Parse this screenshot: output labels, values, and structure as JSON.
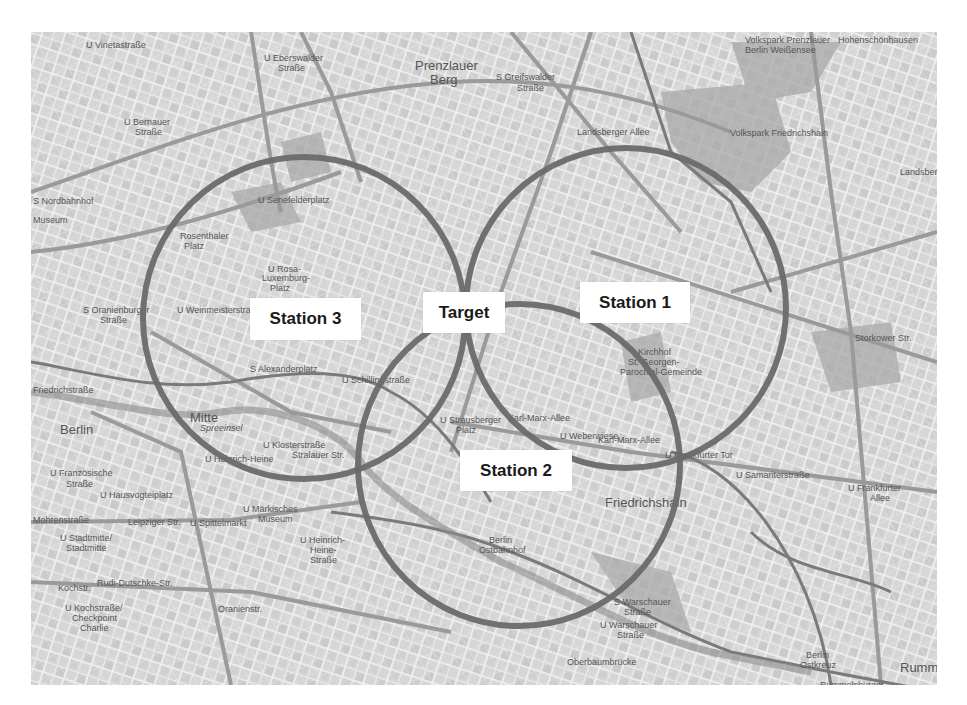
{
  "map": {
    "city": "Berlin",
    "style": "grayscale street map",
    "background_color": "#d9d9d9",
    "circle_color": "#6a6a6a",
    "place_labels": [
      {
        "text": "U Vinetastraße",
        "x": 86,
        "y": 45
      },
      {
        "text": "U Eberswalder",
        "x": 264,
        "y": 58
      },
      {
        "text": "Straße",
        "x": 278,
        "y": 68
      },
      {
        "text": "Prenzlauer",
        "x": 415,
        "y": 66,
        "big": true
      },
      {
        "text": "Berg",
        "x": 430,
        "y": 80,
        "big": true
      },
      {
        "text": "S Greifswalder",
        "x": 496,
        "y": 77
      },
      {
        "text": "Straße",
        "x": 517,
        "y": 88
      },
      {
        "text": "Hohenschönhausen",
        "x": 838,
        "y": 40
      },
      {
        "text": "Volkspark Prenzlauer",
        "x": 745,
        "y": 40
      },
      {
        "text": "Berlin Weißensee",
        "x": 745,
        "y": 50
      },
      {
        "text": "U Bernauer",
        "x": 124,
        "y": 122
      },
      {
        "text": "Straße",
        "x": 135,
        "y": 132
      },
      {
        "text": "Landsberger Allee",
        "x": 577,
        "y": 132
      },
      {
        "text": "Volkspark Friedrichshain",
        "x": 730,
        "y": 133
      },
      {
        "text": "U Senefelderplatz",
        "x": 258,
        "y": 200
      },
      {
        "text": "S Nordbahnhof",
        "x": 33,
        "y": 201
      },
      {
        "text": "Museum",
        "x": 33,
        "y": 220
      },
      {
        "text": "Rosenthaler",
        "x": 180,
        "y": 236
      },
      {
        "text": "Platz",
        "x": 184,
        "y": 246
      },
      {
        "text": "U Rosa-",
        "x": 268,
        "y": 269
      },
      {
        "text": "Luxemburg-",
        "x": 262,
        "y": 278
      },
      {
        "text": "Platz",
        "x": 270,
        "y": 288
      },
      {
        "text": "Landsberger",
        "x": 900,
        "y": 172
      },
      {
        "text": "S Oranienburger",
        "x": 83,
        "y": 310
      },
      {
        "text": "Straße",
        "x": 100,
        "y": 320
      },
      {
        "text": "U Weinmeisterstraße",
        "x": 177,
        "y": 310
      },
      {
        "text": "S Alexanderplatz",
        "x": 250,
        "y": 369
      },
      {
        "text": "U Schillingstraße",
        "x": 342,
        "y": 380
      },
      {
        "text": "Kirchhof",
        "x": 638,
        "y": 352
      },
      {
        "text": "St. Georgen-",
        "x": 628,
        "y": 362
      },
      {
        "text": "Parochial-Gemeinde",
        "x": 620,
        "y": 372
      },
      {
        "text": "Storkower Str.",
        "x": 855,
        "y": 338
      },
      {
        "text": "Friedrichstraße",
        "x": 33,
        "y": 390
      },
      {
        "text": "Berlin",
        "x": 60,
        "y": 430,
        "big": true
      },
      {
        "text": "Mitte",
        "x": 190,
        "y": 418,
        "big": true
      },
      {
        "text": "Spreeinsel",
        "x": 200,
        "y": 428,
        "italic": true
      },
      {
        "text": "U Strausberger",
        "x": 440,
        "y": 420
      },
      {
        "text": "Platz",
        "x": 456,
        "y": 430
      },
      {
        "text": "Karl-Marx-Allee",
        "x": 508,
        "y": 418
      },
      {
        "text": "U Weberwiese",
        "x": 560,
        "y": 436
      },
      {
        "text": "Karl-Marx-Allee",
        "x": 598,
        "y": 440
      },
      {
        "text": "U Frankfurter Tor",
        "x": 665,
        "y": 455
      },
      {
        "text": "U Klosterstraße",
        "x": 263,
        "y": 445
      },
      {
        "text": "Stralauer Str.",
        "x": 292,
        "y": 455
      },
      {
        "text": "U Heinrich-Heine",
        "x": 205,
        "y": 459
      },
      {
        "text": "U Samariterstraße",
        "x": 736,
        "y": 475
      },
      {
        "text": "U Französische",
        "x": 50,
        "y": 473
      },
      {
        "text": "Straße",
        "x": 66,
        "y": 484
      },
      {
        "text": "U Hausvogteiplatz",
        "x": 100,
        "y": 495
      },
      {
        "text": "Friedrichshain",
        "x": 605,
        "y": 503,
        "big": true
      },
      {
        "text": "U Frankfurter",
        "x": 848,
        "y": 488
      },
      {
        "text": "Allee",
        "x": 870,
        "y": 498
      },
      {
        "text": "Leipziger Str.",
        "x": 128,
        "y": 522
      },
      {
        "text": "U Spittelmarkt",
        "x": 190,
        "y": 523
      },
      {
        "text": "U Märkisches",
        "x": 243,
        "y": 509
      },
      {
        "text": "Museum",
        "x": 258,
        "y": 519
      },
      {
        "text": "Mohrenstraße",
        "x": 33,
        "y": 520
      },
      {
        "text": "U Stadtmitte/",
        "x": 60,
        "y": 538
      },
      {
        "text": "Stadtmitte",
        "x": 66,
        "y": 548
      },
      {
        "text": "U Heinrich-",
        "x": 300,
        "y": 540
      },
      {
        "text": "Heine-",
        "x": 310,
        "y": 550
      },
      {
        "text": "Straße",
        "x": 310,
        "y": 560
      },
      {
        "text": "Berlin",
        "x": 489,
        "y": 540
      },
      {
        "text": "Ostbahnhof",
        "x": 479,
        "y": 550
      },
      {
        "text": "Rudi-Dutschke-Str.",
        "x": 97,
        "y": 583
      },
      {
        "text": "Kochstr.",
        "x": 58,
        "y": 588
      },
      {
        "text": "U Kochstraße/",
        "x": 65,
        "y": 608
      },
      {
        "text": "Checkpoint",
        "x": 72,
        "y": 618
      },
      {
        "text": "Charlie",
        "x": 80,
        "y": 628
      },
      {
        "text": "Oranienstr.",
        "x": 218,
        "y": 609
      },
      {
        "text": "S Warschauer",
        "x": 614,
        "y": 602
      },
      {
        "text": "Straße",
        "x": 624,
        "y": 612
      },
      {
        "text": "U Warschauer",
        "x": 600,
        "y": 625
      },
      {
        "text": "Straße",
        "x": 617,
        "y": 635
      },
      {
        "text": "Oberbaumbrücke",
        "x": 567,
        "y": 662
      },
      {
        "text": "Berlin",
        "x": 806,
        "y": 655
      },
      {
        "text": "Ostkreuz",
        "x": 800,
        "y": 665
      },
      {
        "text": "Rummelsburg",
        "x": 900,
        "y": 668,
        "big": true
      },
      {
        "text": "Rummelsburger",
        "x": 820,
        "y": 685
      }
    ]
  },
  "stations": [
    {
      "name": "Station 1",
      "label": "Station 1",
      "circle": {
        "cx": 626,
        "cy": 308,
        "r": 160
      },
      "box": {
        "x": 580,
        "y": 282,
        "w": 110,
        "h": 41
      }
    },
    {
      "name": "Station 2",
      "label": "Station 2",
      "circle": {
        "cx": 519,
        "cy": 465,
        "r": 161
      },
      "box": {
        "x": 460,
        "y": 450,
        "w": 112,
        "h": 41
      }
    },
    {
      "name": "Station 3",
      "label": "Station 3",
      "circle": {
        "cx": 304,
        "cy": 318,
        "r": 161
      },
      "box": {
        "x": 250,
        "y": 298,
        "w": 111,
        "h": 42
      }
    }
  ],
  "target": {
    "label": "Target",
    "box": {
      "x": 423,
      "y": 292,
      "w": 82,
      "h": 41
    }
  }
}
